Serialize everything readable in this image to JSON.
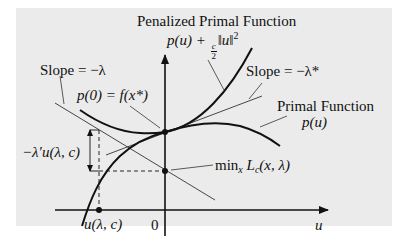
{
  "labels": {
    "penalized_title": "Penalized Primal Function",
    "penalized_formula": {
      "p_u": "p(u) +",
      "frac_num": "c",
      "frac_den": "2",
      "norm": "‖u‖",
      "exp": "2"
    },
    "slope_lambda": "Slope = −λ",
    "slope_lambda_star": "Slope = −λ*",
    "p0_eq": "p(0) = f(x*)",
    "primal_title": "Primal Function",
    "primal_formula": "p(u)",
    "neg_lambda_u": "−λ′u(λ, c)",
    "min_text": "min",
    "min_sub": "x",
    "min_rest": "L",
    "min_rest_sub": "c",
    "min_args": "(x, λ)",
    "u_point": "u(λ, c)",
    "origin": "0",
    "axis_u": "u"
  },
  "colors": {
    "background": "#ebebeb",
    "ink": "#111111",
    "thin_line": "#333333"
  }
}
